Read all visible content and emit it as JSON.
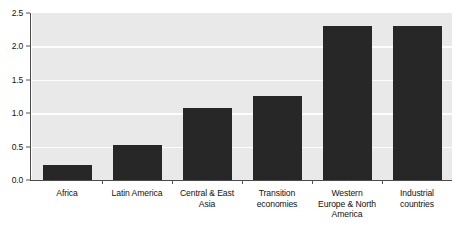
{
  "chart_data": {
    "type": "bar",
    "title": "",
    "subtitle": "",
    "xlabel": "",
    "ylabel": "",
    "categories": [
      "Africa",
      "Latin America",
      "Central & East Asia",
      "Transition economies",
      "Western Europe & North America",
      "Industrial countries"
    ],
    "values": [
      0.22,
      0.52,
      1.08,
      1.26,
      2.3,
      2.31
    ],
    "ylim": [
      0.0,
      2.5
    ],
    "ytick_labels": [
      "0.0",
      "0.5",
      "1.0",
      "1.5",
      "2.0",
      "2.5"
    ],
    "ytick_values": [
      0.0,
      0.5,
      1.0,
      1.5,
      2.0,
      2.5
    ],
    "grid": true,
    "grid_axis": "y",
    "grid_color": "#fdfdfd",
    "legend": false,
    "legend_position": "none",
    "bar_color": "#272727",
    "plot_background": "#e9e9e9",
    "figure_background": "#ffffff",
    "axis_color": "#4a4a4a"
  },
  "axis": {
    "y_ticks": [
      {
        "label": "2.5",
        "value": 2.5
      },
      {
        "label": "2.0",
        "value": 2.0
      },
      {
        "label": "1.5",
        "value": 1.5
      },
      {
        "label": "1.0",
        "value": 1.0
      },
      {
        "label": "0.5",
        "value": 0.5
      },
      {
        "label": "0.0",
        "value": 0.0
      }
    ],
    "x_categories": [
      {
        "label": "Africa",
        "lines": [
          "Africa"
        ]
      },
      {
        "label": "Latin America",
        "lines": [
          "Latin America"
        ]
      },
      {
        "label": "Central & East Asia",
        "lines": [
          "Central & East",
          "Asia"
        ]
      },
      {
        "label": "Transition economies",
        "lines": [
          "Transition",
          "economies"
        ]
      },
      {
        "label": "Western Europe & North America",
        "lines": [
          "Western",
          "Europe & North",
          "America"
        ]
      },
      {
        "label": "Industrial countries",
        "lines": [
          "Industrial",
          "countries"
        ]
      }
    ]
  }
}
